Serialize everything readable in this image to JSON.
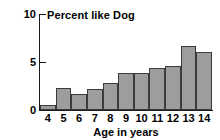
{
  "chart_data": {
    "type": "bar",
    "title": "Percent like Dog",
    "xlabel": "Age in years",
    "ylabel": "",
    "categories": [
      "4",
      "5",
      "6",
      "7",
      "8",
      "9",
      "10",
      "11",
      "12",
      "13",
      "14"
    ],
    "values": [
      0.5,
      2.3,
      1.7,
      2.2,
      2.8,
      3.9,
      3.9,
      4.4,
      4.6,
      6.7,
      6.0
    ],
    "ylim": [
      0,
      10
    ],
    "yticks": [
      0,
      5,
      10
    ],
    "ytick_labels": [
      "0",
      "5",
      "10"
    ],
    "grid": false,
    "legend": null,
    "bar_color": "#9d9d9d",
    "bar_edge_color": "#3b3b3b",
    "axis_color": "#1a1a1a"
  }
}
